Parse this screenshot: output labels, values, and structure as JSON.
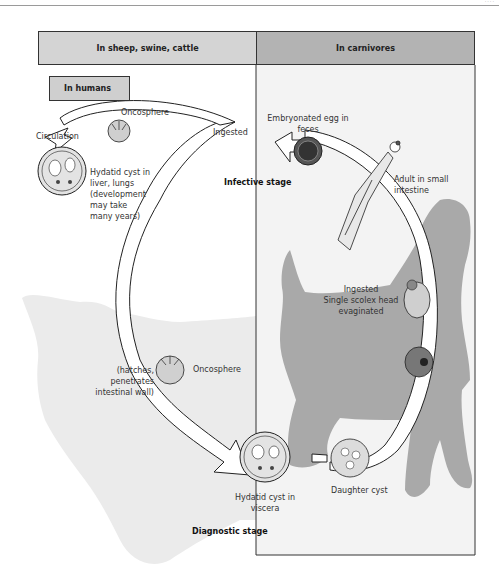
{
  "page": {
    "corner_mark": "····"
  },
  "headers": {
    "intermediate_hosts": "In sheep, swine, cattle",
    "definitive_hosts": "In carnivores",
    "humans": "In humans"
  },
  "labels": {
    "oncosphere_top": "Oncosphere",
    "circulation": "Circulation",
    "ingested_top": "Ingested",
    "hydatid_liver": [
      "Hydatid cyst in",
      "liver, lungs",
      "(development",
      "may take",
      "many years)"
    ],
    "infective_stage": "Infective stage",
    "embryonated_egg": [
      "Embryonated egg in",
      "feces"
    ],
    "adult": [
      "Adult in small",
      "intestine"
    ],
    "ingested_scolex": [
      "Ingested",
      "Single scolex head",
      "evaginated"
    ],
    "hatches": [
      "(hatches,",
      "penetrates",
      "intestinal wall)"
    ],
    "oncosphere_bottom": "Oncosphere",
    "hydatid_viscera": [
      "Hydatid cyst in",
      "viscera"
    ],
    "daughter_cyst": "Daughter cyst",
    "diagnostic_stage": "Diagnostic stage"
  },
  "colors": {
    "left_header": "#d4d4d4",
    "right_header": "#b3b3b3",
    "humans_box": "#cfcfcf",
    "sheep_silhouette": "#ebebeb",
    "dog_silhouette": "#a9a9a9",
    "right_panel_bg": "#f3f3f3",
    "outline": "#222222"
  }
}
